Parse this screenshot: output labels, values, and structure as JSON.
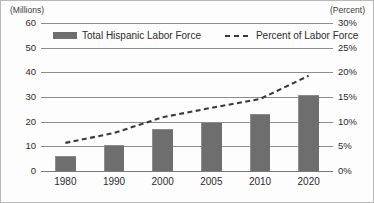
{
  "chart_data": {
    "type": "bar",
    "title": "",
    "categories": [
      "1980",
      "1990",
      "2000",
      "2005",
      "2010",
      "2020"
    ],
    "series": [
      {
        "name": "Total Hispanic Labor Force",
        "type": "bar",
        "axis": "left",
        "unit": "Millions",
        "values": [
          6,
          10.5,
          17,
          20,
          23,
          31
        ],
        "color": "#6e6e6e"
      },
      {
        "name": "Percent of Labor Force",
        "type": "line",
        "style": "dashed",
        "axis": "right",
        "unit": "Percent",
        "values": [
          5.7,
          7.7,
          10.9,
          12.8,
          14.6,
          19.3
        ],
        "color": "#3a3a3a"
      }
    ],
    "xlabel": "",
    "ylabel": "(Millions)",
    "y2label": "(Percent)",
    "ylim": [
      0,
      60
    ],
    "y2lim": [
      0,
      30
    ],
    "yticks": [
      "0",
      "10",
      "20",
      "30",
      "40",
      "50",
      "60"
    ],
    "ytick_values": [
      0,
      10,
      20,
      30,
      40,
      50,
      60
    ],
    "y2ticks": [
      "0%",
      "5%",
      "10%",
      "15%",
      "20%",
      "25%",
      "30%"
    ],
    "y2tick_values": [
      0,
      5,
      10,
      15,
      20,
      25,
      30
    ],
    "grid": true,
    "legend_position": "top-inside"
  },
  "axes": {
    "left_caption": "(Millions)",
    "right_caption": "(Percent)"
  },
  "legend": {
    "bar_label": "Total Hispanic Labor Force",
    "line_label": "Percent of Labor Force"
  }
}
